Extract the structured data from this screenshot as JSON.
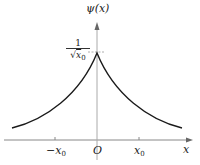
{
  "diagram": {
    "y_axis_label": "ψ(x)",
    "x_axis_label": "x",
    "origin_label": "O",
    "peak_label": {
      "numerator": "1",
      "denominator_sqrt": "√",
      "denominator_var": "x",
      "denominator_sub": "0"
    },
    "ticks": [
      {
        "prefix": "−",
        "var": "x",
        "sub": "0"
      },
      {
        "prefix": "",
        "var": "x",
        "sub": "0"
      }
    ],
    "curve": "ψ(x) = (1/√x0) · e^(−|x|/x0)",
    "colors": {
      "axis": "#888888",
      "curve": "#1a1a1a",
      "text": "#222222"
    }
  }
}
